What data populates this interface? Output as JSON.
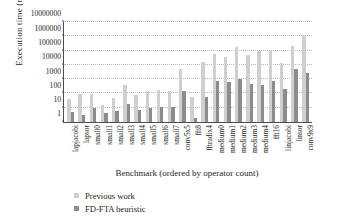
{
  "chart_data": {
    "type": "bar",
    "title": "",
    "xlabel": "Benchmark (ordered by operator count)",
    "ylabel": "Execution time (ms)",
    "yscale": "log",
    "ylim": [
      1,
      10000000
    ],
    "ytick_labels": [
      "1",
      "10",
      "100",
      "1000",
      "10000",
      "100000",
      "1000000",
      "10000000"
    ],
    "ytick_values": [
      1,
      10,
      100,
      1000,
      10000,
      100000,
      1000000,
      10000000
    ],
    "grid": true,
    "legend_position": "below-left",
    "categories": [
      "lapjacobi",
      "lapsor",
      "small0",
      "small1",
      "small2",
      "small3",
      "small4",
      "small5",
      "small6",
      "small7",
      "conv5x5",
      "fft8",
      "fftradix4",
      "medium0",
      "medium1",
      "medium2",
      "medium3",
      "medium4",
      "fft16",
      "linjacobi",
      "linsor",
      "conv9x9"
    ],
    "series": [
      {
        "name": "Previous work",
        "color": "#cfcfcf",
        "values": [
          40,
          90,
          85,
          16,
          45,
          380,
          75,
          150,
          170,
          150,
          5000,
          55,
          16000,
          60000,
          35000,
          180000,
          50000,
          90000,
          95000,
          13000,
          200000,
          1000000
        ]
      },
      {
        "name": "FD-FTA heuristic",
        "color": "#8c8c8c",
        "values": [
          5,
          3,
          9,
          4,
          6,
          17,
          7,
          10,
          12,
          12,
          150,
          2,
          60,
          800,
          600,
          1100,
          430,
          400,
          700,
          220,
          5000,
          2800
        ]
      }
    ]
  },
  "legend": {
    "items": [
      {
        "label": "Previous work",
        "color": "#cfcfcf"
      },
      {
        "label": "FD-FTA heuristic",
        "color": "#8c8c8c"
      }
    ]
  }
}
